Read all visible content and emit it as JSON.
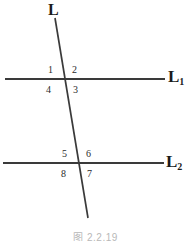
{
  "figure": {
    "background_color": "#ffffff",
    "stroke_color": "#3a3a3a",
    "text_color": "#1a1a1a",
    "caption": "图 2.2.19"
  },
  "lines": {
    "transversal": {
      "label": "L",
      "label_x": 48,
      "label_y": 2,
      "x1": 55,
      "y1": 18,
      "x2": 88,
      "y2": 218
    },
    "first_parallel": {
      "label": "L",
      "subscript": "1",
      "label_x": 168,
      "label_y": 68,
      "x1": 5,
      "y1": 79,
      "x2": 165,
      "y2": 79
    },
    "second_parallel": {
      "label": "L",
      "subscript": "2",
      "label_x": 166,
      "label_y": 153,
      "x1": 3,
      "y1": 163,
      "x2": 164,
      "y2": 163
    }
  },
  "intersections": [
    {
      "name": "upper-intersection",
      "x": 65,
      "y": 79,
      "angles": [
        {
          "id": "angle-1",
          "number": "1",
          "position": "upper-left",
          "x": 48,
          "y": 65
        },
        {
          "id": "angle-2",
          "number": "2",
          "position": "upper-right",
          "x": 72,
          "y": 65
        },
        {
          "id": "angle-4",
          "number": "4",
          "position": "lower-left",
          "x": 46,
          "y": 85
        },
        {
          "id": "angle-3",
          "number": "3",
          "position": "lower-right",
          "x": 73,
          "y": 85
        }
      ]
    },
    {
      "name": "lower-intersection",
      "x": 79,
      "y": 163,
      "angles": [
        {
          "id": "angle-5",
          "number": "5",
          "position": "upper-left",
          "x": 62,
          "y": 149
        },
        {
          "id": "angle-6",
          "number": "6",
          "position": "upper-right",
          "x": 86,
          "y": 149
        },
        {
          "id": "angle-8",
          "number": "8",
          "position": "lower-left",
          "x": 61,
          "y": 169
        },
        {
          "id": "angle-7",
          "number": "7",
          "position": "lower-right",
          "x": 87,
          "y": 169
        }
      ]
    }
  ]
}
